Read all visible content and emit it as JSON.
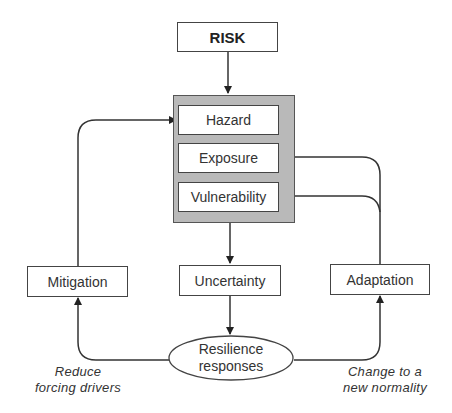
{
  "diagram": {
    "title_node": "RISK",
    "components_group": {
      "items": [
        "Hazard",
        "Exposure",
        "Vulnerability"
      ]
    },
    "uncertainty": "Uncertainty",
    "mitigation": "Mitigation",
    "adaptation": "Adaptation",
    "resilience": {
      "line1": "Resilience",
      "line2": "responses"
    },
    "notes": {
      "left_line1": "Reduce",
      "left_line2": "forcing drivers",
      "right_line1": "Change to a",
      "right_line2": "new normality"
    },
    "colors": {
      "group_fill": "#b9b9b9",
      "stroke": "#333333",
      "box_fill": "#ffffff"
    }
  }
}
